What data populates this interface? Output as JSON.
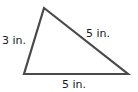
{
  "diagram": {
    "shape": "triangle",
    "stroke_color": "#4a4a4a",
    "vertices": {
      "top": [
        44,
        8
      ],
      "bottom_left": [
        24,
        74
      ],
      "bottom_right": [
        128,
        74
      ]
    },
    "labels": {
      "left_side": "3 in.",
      "right_side": "5 in.",
      "bottom_side": "5 in."
    }
  }
}
